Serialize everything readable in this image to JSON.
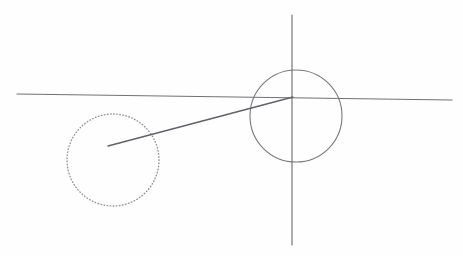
{
  "figure": {
    "background_color": "#ffffff",
    "width": 463,
    "height": 256,
    "ink_color": "#6f7176",
    "dotted_ink_color": "#8e9096",
    "secant_color": "#5f6166"
  },
  "chart_data": {
    "type": "diagram",
    "xlabel": "",
    "ylabel": "",
    "grid": false,
    "legend": "none",
    "xlim": [
      0,
      463
    ],
    "ylim": [
      256,
      0
    ],
    "elements": [
      {
        "name": "x-axis",
        "kind": "line",
        "style": "solid",
        "x1": 17,
        "y1": 94,
        "x2": 452,
        "y2": 100,
        "color": "#6f7176"
      },
      {
        "name": "y-axis",
        "kind": "line",
        "style": "solid",
        "x1": 292,
        "y1": 15,
        "x2": 292,
        "y2": 245,
        "color": "#6f7176"
      },
      {
        "name": "solid-circle",
        "kind": "circle",
        "style": "solid",
        "cx": 296,
        "cy": 116,
        "r": 46,
        "color": "#76787d"
      },
      {
        "name": "dotted-circle",
        "kind": "circle",
        "style": "dotted",
        "cx": 113,
        "cy": 160,
        "r": 46,
        "color": "#8e9096"
      },
      {
        "name": "secant-line",
        "kind": "line",
        "style": "solid",
        "x1": 108,
        "y1": 146,
        "x2": 293,
        "y2": 97,
        "color": "#5f6166"
      }
    ],
    "annotations": [],
    "labels": []
  }
}
